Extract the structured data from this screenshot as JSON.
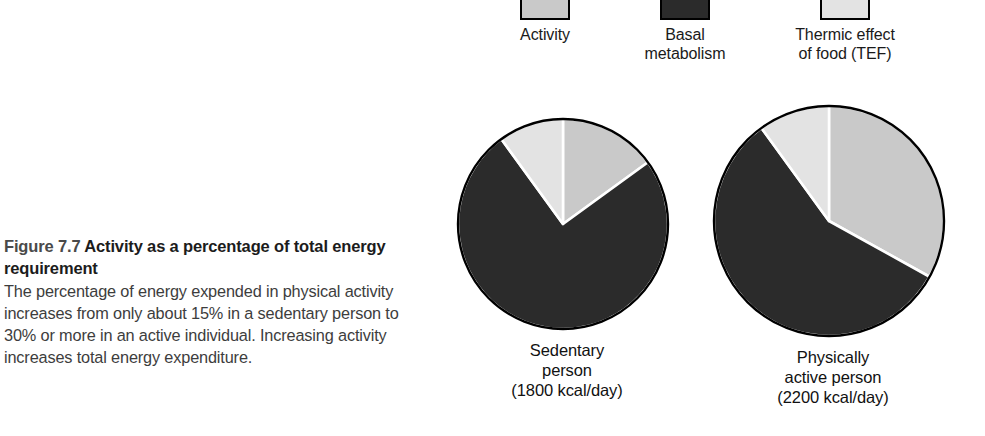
{
  "figure": {
    "number": "Figure 7.7",
    "title": "Activity as a percentage of total energy requirement",
    "body": "The percentage of energy expended in physical activity increases from only about 15% in a sedentary person to 30% or more in an active individual. Increasing activity increases total energy expenditure."
  },
  "legend": {
    "items": [
      {
        "key": "activity",
        "label": "Activity",
        "color": "#c9c9c9"
      },
      {
        "key": "basal",
        "label": "Basal\nmetabolism",
        "color": "#2b2b2b"
      },
      {
        "key": "tef",
        "label": "Thermic effect\nof food (TEF)",
        "color": "#e3e3e3"
      }
    ]
  },
  "chart_data": {
    "type": "pie",
    "title": "Activity as a percentage of total energy requirement",
    "legend_position": "top",
    "categories": [
      "Activity",
      "Basal metabolism",
      "Thermic effect of food (TEF)"
    ],
    "colors": [
      "#c9c9c9",
      "#2b2b2b",
      "#e3e3e3"
    ],
    "charts": [
      {
        "key": "sedentary",
        "label": "Sedentary\nperson\n(1800 kcal/day)",
        "caption_line1": "Sedentary",
        "caption_line2": "person",
        "caption_line3": "(1800 kcal/day)",
        "total_kcal_per_day": 1800,
        "values": [
          15,
          75,
          10
        ],
        "unit": "%",
        "slices": [
          {
            "name": "Activity",
            "value": 15,
            "color": "#c9c9c9",
            "start_angle": 0,
            "end_angle": 54
          },
          {
            "name": "Basal metabolism",
            "value": 75,
            "color": "#2b2b2b",
            "start_angle": 54,
            "end_angle": 324
          },
          {
            "name": "Thermic effect of food (TEF)",
            "value": 10,
            "color": "#e3e3e3",
            "start_angle": 324,
            "end_angle": 360
          }
        ]
      },
      {
        "key": "active",
        "label": "Physically\nactive person\n(2200 kcal/day)",
        "caption_line1": "Physically",
        "caption_line2": "active person",
        "caption_line3": "(2200 kcal/day)",
        "total_kcal_per_day": 2200,
        "values": [
          33,
          57,
          10
        ],
        "unit": "%",
        "slices": [
          {
            "name": "Activity",
            "value": 33,
            "color": "#c9c9c9",
            "start_angle": 0,
            "end_angle": 119
          },
          {
            "name": "Basal metabolism",
            "value": 57,
            "color": "#2b2b2b",
            "start_angle": 119,
            "end_angle": 324
          },
          {
            "name": "Thermic effect of food (TEF)",
            "value": 10,
            "color": "#e3e3e3",
            "start_angle": 324,
            "end_angle": 360
          }
        ]
      }
    ]
  },
  "style": {
    "outline_color": "#000000",
    "divider_color": "#ffffff",
    "background": "#ffffff"
  }
}
